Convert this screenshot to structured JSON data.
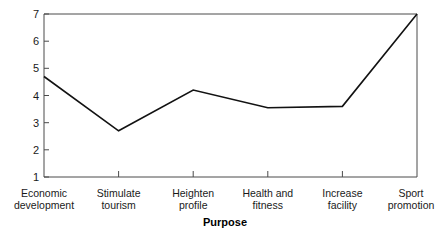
{
  "chart_data": {
    "type": "line",
    "title": "",
    "subtitle": "",
    "xlabel": "Purpose",
    "ylabel": "",
    "categories": [
      "Economic development",
      "Stimulate tourism",
      "Heighten profile",
      "Health and fitness",
      "Increase facility",
      "Sport promotion"
    ],
    "category_lines": [
      [
        "Economic",
        "development"
      ],
      [
        "Stimulate",
        "tourism"
      ],
      [
        "Heighten",
        "profile"
      ],
      [
        "Health and",
        "fitness"
      ],
      [
        "Increase",
        "facility"
      ],
      [
        "Sport",
        "promotion"
      ]
    ],
    "values": [
      4.7,
      2.7,
      4.2,
      3.55,
      3.6,
      7.0
    ],
    "series": [
      {
        "name": "Mean rating",
        "values": [
          4.7,
          2.7,
          4.2,
          3.55,
          3.6,
          7.0
        ]
      }
    ],
    "ylim": [
      1,
      7
    ],
    "yticks": [
      1,
      2,
      3,
      4,
      5,
      6,
      7
    ],
    "ytick_labels": [
      "1",
      "2",
      "3",
      "4",
      "5",
      "6",
      "7"
    ],
    "grid": false,
    "legend": false,
    "legend_position": "none",
    "line_color": "#121212",
    "axis_color": "#4a4a4a",
    "background": "#ffffff",
    "annotations": []
  },
  "axis": {
    "y_tick_labels": [
      "7",
      "6",
      "5",
      "4",
      "3",
      "2",
      "1"
    ],
    "x_title": "Purpose"
  }
}
